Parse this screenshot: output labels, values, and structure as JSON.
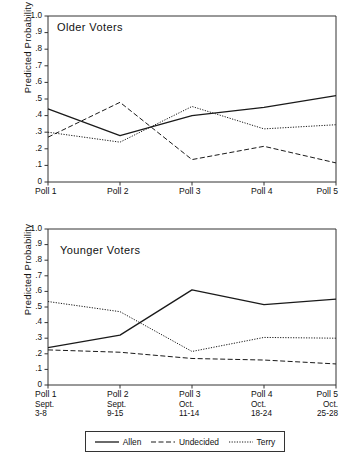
{
  "chart_data": [
    {
      "type": "line",
      "title": "Older Voters",
      "xlabel": "",
      "ylabel": "Predicted Probability",
      "categories": [
        "Poll 1",
        "Poll 2",
        "Poll 3",
        "Poll 4",
        "Poll 5"
      ],
      "x_tick_labels": [
        "Poll 1",
        "Poll 2",
        "Poll 3",
        "Poll 4",
        "Poll 5"
      ],
      "y_tick_labels": [
        "0",
        ".1",
        ".2",
        ".3",
        ".4",
        ".5",
        ".6",
        ".7",
        ".8",
        ".9",
        "1.0"
      ],
      "ylim": [
        0,
        1.0
      ],
      "grid": false,
      "legend_position": "below-figure",
      "series": [
        {
          "name": "Allen",
          "style": "solid",
          "values": [
            0.44,
            0.28,
            0.4,
            0.45,
            0.52
          ]
        },
        {
          "name": "Undecided",
          "style": "dashed",
          "values": [
            0.27,
            0.48,
            0.135,
            0.215,
            0.115
          ]
        },
        {
          "name": "Terry",
          "style": "dotted",
          "values": [
            0.3,
            0.24,
            0.455,
            0.32,
            0.345
          ]
        }
      ]
    },
    {
      "type": "line",
      "title": "Younger Voters",
      "xlabel": "",
      "ylabel": "Predicted Probability",
      "categories": [
        "Poll 1",
        "Poll 2",
        "Poll 3",
        "Poll 4",
        "Poll 5"
      ],
      "x_tick_labels": [
        "Poll 1",
        "Poll 2",
        "Poll 3",
        "Poll 4",
        "Poll 5"
      ],
      "x_tick_sublabels": [
        [
          "Sept.",
          "3-8"
        ],
        [
          "Sept.",
          "9-15"
        ],
        [
          "Oct.",
          "11-14"
        ],
        [
          "Oct.",
          "18-24"
        ],
        [
          "Oct.",
          "25-28"
        ]
      ],
      "y_tick_labels": [
        "0",
        ".1",
        ".2",
        ".3",
        ".4",
        ".5",
        ".6",
        ".7",
        ".8",
        ".9",
        "1.0"
      ],
      "ylim": [
        0,
        1.0
      ],
      "grid": false,
      "legend_position": "below-figure",
      "series": [
        {
          "name": "Allen",
          "style": "solid",
          "values": [
            0.24,
            0.32,
            0.61,
            0.515,
            0.55
          ]
        },
        {
          "name": "Undecided",
          "style": "dashed",
          "values": [
            0.225,
            0.21,
            0.17,
            0.16,
            0.135
          ]
        },
        {
          "name": "Terry",
          "style": "dotted",
          "values": [
            0.535,
            0.47,
            0.215,
            0.305,
            0.3
          ]
        }
      ]
    }
  ],
  "older": {
    "label": "Older Voters",
    "ylabel": "Predicted Probability",
    "y_ticks": [
      "1.0",
      ".9",
      ".8",
      ".7",
      ".6",
      ".5",
      ".4",
      ".3",
      ".2",
      ".1",
      "0"
    ],
    "x_ticks": [
      "Poll 1",
      "Poll 2",
      "Poll 3",
      "Poll 4",
      "Poll 5"
    ]
  },
  "younger": {
    "label": "Younger Voters",
    "ylabel": "Predicted Probability",
    "y_ticks": [
      "1.0",
      ".9",
      ".8",
      ".7",
      ".6",
      ".5",
      ".4",
      ".3",
      ".2",
      ".1",
      "0"
    ],
    "x_ticks": [
      {
        "poll": "Poll 1",
        "month": "Sept.",
        "days": "3-8"
      },
      {
        "poll": "Poll 2",
        "month": "Sept.",
        "days": "9-15"
      },
      {
        "poll": "Poll 3",
        "month": "Oct.",
        "days": "11-14"
      },
      {
        "poll": "Poll 4",
        "month": "Oct.",
        "days": "18-24"
      },
      {
        "poll": "Poll 5",
        "month": "Oct.",
        "days": "25-28"
      }
    ]
  },
  "legend": {
    "items": [
      {
        "label": "Allen",
        "style": "solid"
      },
      {
        "label": "Undecided",
        "style": "dashed"
      },
      {
        "label": "Terry",
        "style": "dotted"
      }
    ]
  },
  "colors": {
    "line": "#1a1a1a",
    "axis": "#333333",
    "background": "#ffffff"
  }
}
